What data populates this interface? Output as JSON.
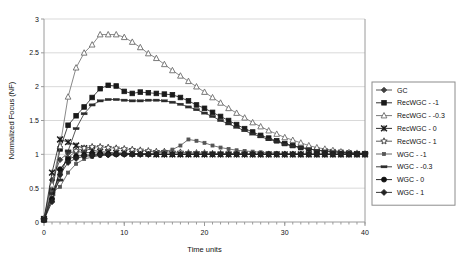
{
  "chart_data": {
    "type": "line",
    "title": "",
    "xlabel": "Time units",
    "ylabel": "Normalized Focus (NF)",
    "xlim": [
      0,
      40
    ],
    "ylim": [
      0,
      3
    ],
    "grid": true,
    "legend_position": "right",
    "x_ticks": [
      0,
      10,
      20,
      30,
      40
    ],
    "x_tick_labels": [
      "0",
      "10",
      "20",
      "30",
      "40"
    ],
    "x_minor_tick_step": 1,
    "y_ticks": [
      0,
      0.5,
      1,
      1.5,
      2,
      2.5,
      3
    ],
    "y_tick_labels": [
      "0",
      "0.5",
      "1",
      "1.5",
      "2",
      "2.5",
      "3"
    ],
    "x": [
      0,
      1,
      2,
      3,
      4,
      5,
      6,
      7,
      8,
      9,
      10,
      11,
      12,
      13,
      14,
      15,
      16,
      17,
      18,
      19,
      20,
      21,
      22,
      23,
      24,
      25,
      26,
      27,
      28,
      29,
      30,
      31,
      32,
      33,
      34,
      35,
      36,
      37,
      38,
      39,
      40
    ],
    "series": [
      {
        "name": "GC",
        "marker": "diamond",
        "color": "#3f3f3f",
        "values": [
          0.05,
          0.62,
          0.92,
          1.02,
          1.04,
          1.03,
          1.02,
          1.02,
          1.01,
          1.01,
          1.01,
          1.01,
          1.0,
          1.0,
          1.0,
          1.0,
          1.0,
          1.0,
          1.0,
          1.0,
          1.0,
          1.0,
          1.0,
          1.0,
          1.0,
          1.0,
          1.0,
          1.0,
          1.0,
          1.0,
          1.0,
          1.0,
          1.0,
          1.0,
          1.0,
          1.0,
          1.0,
          1.0,
          1.0,
          1.0,
          1.0
        ]
      },
      {
        "name": "RecWGC - -1",
        "marker": "square",
        "color": "#1a1a1a",
        "values": [
          0.05,
          0.46,
          1.08,
          1.43,
          1.57,
          1.7,
          1.84,
          1.97,
          2.02,
          2.01,
          1.93,
          1.9,
          1.92,
          1.91,
          1.9,
          1.89,
          1.88,
          1.84,
          1.79,
          1.73,
          1.68,
          1.62,
          1.56,
          1.5,
          1.44,
          1.38,
          1.33,
          1.28,
          1.24,
          1.2,
          1.16,
          1.13,
          1.1,
          1.08,
          1.06,
          1.05,
          1.04,
          1.03,
          1.02,
          1.01,
          1.01
        ]
      },
      {
        "name": "RecWGC - -0.3",
        "marker": "triangle-open",
        "color": "#6b6b6b",
        "values": [
          0.05,
          0.55,
          1.12,
          1.85,
          2.28,
          2.5,
          2.62,
          2.77,
          2.77,
          2.77,
          2.73,
          2.66,
          2.58,
          2.49,
          2.42,
          2.33,
          2.24,
          2.16,
          2.08,
          2.0,
          1.92,
          1.84,
          1.76,
          1.68,
          1.61,
          1.54,
          1.47,
          1.41,
          1.35,
          1.3,
          1.25,
          1.21,
          1.17,
          1.13,
          1.1,
          1.08,
          1.06,
          1.04,
          1.03,
          1.02,
          1.01
        ]
      },
      {
        "name": "RecWGC - 0",
        "marker": "x",
        "color": "#1a1a1a",
        "values": [
          0.04,
          0.73,
          1.22,
          1.18,
          1.13,
          1.09,
          1.06,
          1.04,
          1.03,
          1.02,
          1.02,
          1.01,
          1.01,
          1.01,
          1.0,
          1.0,
          1.0,
          1.0,
          1.0,
          1.0,
          1.0,
          1.0,
          1.0,
          1.0,
          1.0,
          1.0,
          1.0,
          1.0,
          1.0,
          1.0,
          1.0,
          1.0,
          1.0,
          1.0,
          1.0,
          1.0,
          1.0,
          1.0,
          1.0,
          1.0,
          1.0
        ]
      },
      {
        "name": "RecWGC - 1",
        "marker": "star",
        "color": "#4a4a4a",
        "values": [
          0.03,
          0.38,
          0.76,
          0.95,
          1.05,
          1.09,
          1.11,
          1.11,
          1.1,
          1.09,
          1.08,
          1.07,
          1.06,
          1.05,
          1.04,
          1.04,
          1.03,
          1.03,
          1.02,
          1.02,
          1.02,
          1.01,
          1.01,
          1.01,
          1.01,
          1.01,
          1.0,
          1.0,
          1.0,
          1.0,
          1.0,
          1.0,
          1.0,
          1.0,
          1.0,
          1.0,
          1.0,
          1.0,
          1.0,
          1.0,
          1.0
        ]
      },
      {
        "name": "WGC - -1",
        "marker": "square-small",
        "color": "#555555",
        "values": [
          0.04,
          0.44,
          0.52,
          0.73,
          0.86,
          0.93,
          0.96,
          0.98,
          0.99,
          0.99,
          1.0,
          1.0,
          1.0,
          1.01,
          1.02,
          1.04,
          1.07,
          1.13,
          1.22,
          1.2,
          1.17,
          1.13,
          1.1,
          1.08,
          1.06,
          1.05,
          1.04,
          1.03,
          1.02,
          1.02,
          1.01,
          1.01,
          1.01,
          1.0,
          1.0,
          1.0,
          1.0,
          1.0,
          1.0,
          1.0,
          1.0
        ]
      },
      {
        "name": "WGC - -0.3",
        "marker": "dash",
        "color": "#2b2b2b",
        "values": [
          0.04,
          0.42,
          0.62,
          1.05,
          1.38,
          1.6,
          1.73,
          1.79,
          1.81,
          1.81,
          1.8,
          1.79,
          1.79,
          1.8,
          1.8,
          1.79,
          1.77,
          1.74,
          1.7,
          1.66,
          1.61,
          1.56,
          1.5,
          1.45,
          1.4,
          1.35,
          1.3,
          1.26,
          1.22,
          1.19,
          1.15,
          1.12,
          1.1,
          1.08,
          1.06,
          1.05,
          1.04,
          1.03,
          1.02,
          1.01,
          1.01
        ]
      },
      {
        "name": "WGC - 0",
        "marker": "circle",
        "color": "#111111",
        "values": [
          0.03,
          0.34,
          0.78,
          0.93,
          0.97,
          0.99,
          0.99,
          1.0,
          1.0,
          1.0,
          1.0,
          1.0,
          1.0,
          1.0,
          1.0,
          1.0,
          1.0,
          1.0,
          1.0,
          1.0,
          1.0,
          1.0,
          1.0,
          1.0,
          1.0,
          1.0,
          1.0,
          1.0,
          1.0,
          1.0,
          1.0,
          1.0,
          1.0,
          1.0,
          1.0,
          1.0,
          1.0,
          1.0,
          1.0,
          1.0,
          1.0
        ]
      },
      {
        "name": "WGC - 1",
        "marker": "plus-diamond",
        "color": "#222222",
        "values": [
          0.03,
          0.3,
          0.7,
          0.88,
          0.94,
          0.97,
          0.98,
          0.99,
          0.99,
          1.0,
          1.0,
          1.0,
          1.0,
          1.0,
          1.0,
          1.0,
          1.0,
          1.0,
          1.0,
          1.0,
          1.0,
          1.0,
          1.0,
          1.0,
          1.0,
          1.0,
          1.0,
          1.0,
          1.0,
          1.0,
          1.0,
          1.0,
          1.0,
          1.0,
          1.0,
          1.0,
          1.0,
          1.0,
          1.0,
          1.0,
          1.0
        ]
      }
    ]
  },
  "legend": {
    "items": [
      {
        "label": "GC"
      },
      {
        "label": "RecWGC - -1"
      },
      {
        "label": "RecWGC - -0.3"
      },
      {
        "label": "RecWGC - 0"
      },
      {
        "label": "RecWGC - 1"
      },
      {
        "label": "WGC - -1"
      },
      {
        "label": "WGC - -0.3"
      },
      {
        "label": "WGC - 0"
      },
      {
        "label": "WGC - 1"
      }
    ]
  }
}
